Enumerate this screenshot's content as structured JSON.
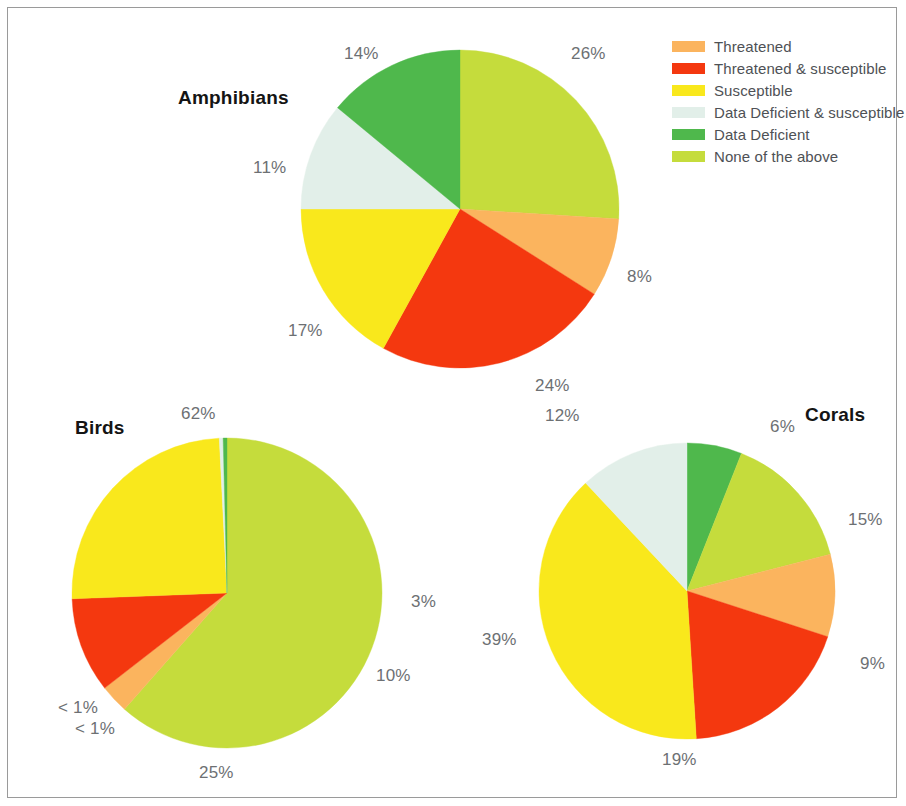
{
  "figure": {
    "background": "#ffffff",
    "frame_color": "#9a9a9a"
  },
  "legend": {
    "position": "top-right",
    "items": [
      {
        "label": "Threatened",
        "color": "#fbb45e"
      },
      {
        "label": "Threatened & susceptible",
        "color": "#f4380f"
      },
      {
        "label": "Susceptible",
        "color": "#f9e81c"
      },
      {
        "label": "Data Deficient & susceptible",
        "color": "#e2efe9"
      },
      {
        "label": "Data Deficient",
        "color": "#4fb84c"
      },
      {
        "label": "None of the above",
        "color": "#c5dc3c"
      }
    ]
  },
  "chart_data": [
    {
      "type": "pie",
      "title": "Amphibians",
      "start_angle_deg": 0,
      "direction": "clockwise",
      "categories": [
        "None of the above",
        "Threatened",
        "Threatened & susceptible",
        "Susceptible",
        "Data Deficient & susceptible",
        "Data Deficient"
      ],
      "values": [
        26,
        8,
        24,
        17,
        11,
        14
      ],
      "labels": [
        "26%",
        "8%",
        "24%",
        "17%",
        "11%",
        "14%"
      ],
      "colors": [
        "#c5dc3c",
        "#fbb45e",
        "#f4380f",
        "#f9e81c",
        "#e2efe9",
        "#4fb84c"
      ]
    },
    {
      "type": "pie",
      "title": "Birds",
      "start_angle_deg": 0,
      "direction": "clockwise",
      "categories": [
        "None of the above",
        "Threatened",
        "Threatened & susceptible",
        "Susceptible",
        "Data Deficient & susceptible",
        "Data Deficient"
      ],
      "values": [
        62,
        3,
        10,
        25,
        0.4,
        0.4
      ],
      "labels": [
        "62%",
        "3%",
        "10%",
        "25%",
        "< 1%",
        "< 1%"
      ],
      "colors": [
        "#c5dc3c",
        "#fbb45e",
        "#f4380f",
        "#f9e81c",
        "#e2efe9",
        "#4fb84c"
      ]
    },
    {
      "type": "pie",
      "title": "Corals",
      "start_angle_deg": 0,
      "direction": "clockwise",
      "categories": [
        "Data Deficient",
        "None of the above",
        "Threatened",
        "Threatened & susceptible",
        "Susceptible",
        "Data Deficient & susceptible"
      ],
      "values": [
        6,
        15,
        9,
        19,
        39,
        12
      ],
      "labels": [
        "6%",
        "15%",
        "9%",
        "19%",
        "39%",
        "12%"
      ],
      "colors": [
        "#4fb84c",
        "#c5dc3c",
        "#fbb45e",
        "#f4380f",
        "#f9e81c",
        "#e2efe9"
      ]
    }
  ],
  "amphibians": {
    "title": "Amphibians",
    "title_pos": {
      "left": 178,
      "top": 87
    },
    "center": {
      "cx": 460,
      "cy": 209
    },
    "radius": 159,
    "labels": [
      {
        "text": "26%",
        "left": 571,
        "top": 44
      },
      {
        "text": "8%",
        "left": 627,
        "top": 267
      },
      {
        "text": "24%",
        "left": 535,
        "top": 376
      },
      {
        "text": "17%",
        "left": 288,
        "top": 321
      },
      {
        "text": "11%",
        "left": 253,
        "top": 158
      },
      {
        "text": "14%",
        "left": 344,
        "top": 44
      }
    ]
  },
  "birds": {
    "title": "Birds",
    "title_pos": {
      "left": 75,
      "top": 417
    },
    "center": {
      "cx": 227,
      "cy": 593
    },
    "radius": 155,
    "labels": [
      {
        "text": "62%",
        "left": 181,
        "top": 404
      },
      {
        "text": "3%",
        "left": 411,
        "top": 592
      },
      {
        "text": "10%",
        "left": 376,
        "top": 666
      },
      {
        "text": "25%",
        "left": 199,
        "top": 763
      },
      {
        "text": "< 1%",
        "left": 58,
        "top": 698
      },
      {
        "text": "< 1%",
        "left": 75,
        "top": 719
      }
    ]
  },
  "corals": {
    "title": "Corals",
    "title_pos": {
      "left": 805,
      "top": 404
    },
    "center": {
      "cx": 687,
      "cy": 591
    },
    "radius": 148,
    "labels": [
      {
        "text": "6%",
        "left": 770,
        "top": 417
      },
      {
        "text": "15%",
        "left": 848,
        "top": 510
      },
      {
        "text": "9%",
        "left": 860,
        "top": 654
      },
      {
        "text": "19%",
        "left": 662,
        "top": 750
      },
      {
        "text": "39%",
        "left": 482,
        "top": 630
      },
      {
        "text": "12%",
        "left": 545,
        "top": 406
      }
    ]
  }
}
